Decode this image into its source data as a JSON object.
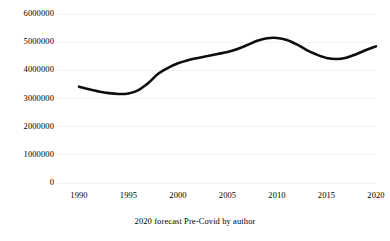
{
  "chart_data": {
    "type": "line",
    "title": "",
    "caption": "2020 forecast Pre-Covid by author",
    "xlabel": "",
    "ylabel": "",
    "x": [
      1990,
      1991,
      1992,
      1993,
      1994,
      1995,
      1996,
      1997,
      1998,
      1999,
      2000,
      2001,
      2002,
      2003,
      2004,
      2005,
      2006,
      2007,
      2008,
      2009,
      2010,
      2011,
      2012,
      2013,
      2014,
      2015,
      2016,
      2017,
      2018,
      2019,
      2020
    ],
    "values": [
      3420000,
      3330000,
      3250000,
      3190000,
      3160000,
      3180000,
      3300000,
      3550000,
      3880000,
      4090000,
      4250000,
      4360000,
      4440000,
      4510000,
      4580000,
      4650000,
      4760000,
      4900000,
      5050000,
      5140000,
      5150000,
      5080000,
      4920000,
      4720000,
      4560000,
      4440000,
      4400000,
      4450000,
      4570000,
      4720000,
      4850000
    ],
    "series": [
      {
        "name": "Forecast",
        "color": "#0d0d0d",
        "values": [
          3420000,
          3330000,
          3250000,
          3190000,
          3160000,
          3180000,
          3300000,
          3550000,
          3880000,
          4090000,
          4250000,
          4360000,
          4440000,
          4510000,
          4580000,
          4650000,
          4760000,
          4900000,
          5050000,
          5140000,
          5150000,
          5080000,
          4920000,
          4720000,
          4560000,
          4440000,
          4400000,
          4450000,
          4570000,
          4720000,
          4850000
        ]
      }
    ],
    "xlim": [
      1990,
      2020
    ],
    "ylim": [
      0,
      6000000
    ],
    "y_ticks": [
      0,
      1000000,
      2000000,
      3000000,
      4000000,
      5000000,
      6000000
    ],
    "y_tick_labels": [
      "0",
      "1000000",
      "2000000",
      "3000000",
      "4000000",
      "5000000",
      "6000000"
    ],
    "x_ticks": [
      1990,
      1995,
      2000,
      2005,
      2010,
      2015,
      2020
    ],
    "x_tick_labels": [
      "1990",
      "1995",
      "2000",
      "2005",
      "2010",
      "2015",
      "2020"
    ],
    "grid": "horizontal",
    "grid_color": "#f2f2f2",
    "legend": "none",
    "background": "#ffffff"
  },
  "axis": {
    "y_labels": [
      {
        "text": "6000000",
        "value": 6000000
      },
      {
        "text": "5000000",
        "value": 5000000
      },
      {
        "text": "4000000",
        "value": 4000000
      },
      {
        "text": "3000000",
        "value": 3000000
      },
      {
        "text": "2000000",
        "value": 2000000
      },
      {
        "text": "1000000",
        "value": 1000000
      },
      {
        "text": "0",
        "value": 0
      }
    ],
    "x_labels": [
      {
        "text": "1990",
        "value": 1990
      },
      {
        "text": "1995",
        "value": 1995
      },
      {
        "text": "2000",
        "value": 2000
      },
      {
        "text": "2005",
        "value": 2005
      },
      {
        "text": "2010",
        "value": 2010
      },
      {
        "text": "2015",
        "value": 2015
      },
      {
        "text": "2020",
        "value": 2020
      }
    ]
  },
  "caption": {
    "text": "2020 forecast Pre-Covid by author"
  }
}
